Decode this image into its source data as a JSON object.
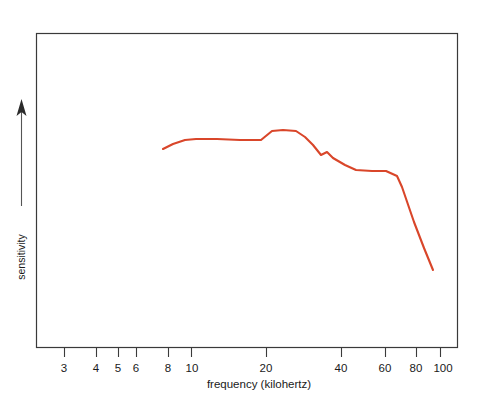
{
  "chart_data": {
    "type": "line",
    "title": "",
    "xlabel": "frequency (kilohertz)",
    "ylabel": "sensitivity",
    "x_scale": "log",
    "xlim": [
      2.4,
      115
    ],
    "ylim": [
      0,
      1
    ],
    "y_axis_ticks": false,
    "y_axis_numeric": false,
    "grid": false,
    "legend": null,
    "frame": "box",
    "xticks": [
      {
        "value": 3,
        "label": "3",
        "px": 64
      },
      {
        "value": 4,
        "label": "4",
        "px": 96
      },
      {
        "value": 5,
        "label": "5",
        "px": 118
      },
      {
        "value": 6,
        "label": "6",
        "px": 136
      },
      {
        "value": 8,
        "label": "8",
        "px": 168
      },
      {
        "value": 10,
        "label": "10",
        "px": 191
      },
      {
        "value": 20,
        "label": "20",
        "px": 266
      },
      {
        "value": 40,
        "label": "40",
        "px": 341
      },
      {
        "value": 60,
        "label": "60",
        "px": 385
      },
      {
        "value": 80,
        "label": "80",
        "px": 416
      },
      {
        "value": 100,
        "label": "100",
        "px": 440
      }
    ],
    "series": [
      {
        "name": "sensitivity curve",
        "color": "#D9462A",
        "points_px": [
          [
            163,
            149
          ],
          [
            173,
            144
          ],
          [
            185,
            140
          ],
          [
            196,
            139
          ],
          [
            217,
            139
          ],
          [
            240,
            140
          ],
          [
            261,
            140
          ],
          [
            272,
            131
          ],
          [
            283,
            130
          ],
          [
            296,
            131
          ],
          [
            305,
            137
          ],
          [
            313,
            145
          ],
          [
            321,
            155
          ],
          [
            327,
            152
          ],
          [
            333,
            158
          ],
          [
            345,
            165
          ],
          [
            356,
            170
          ],
          [
            372,
            171
          ],
          [
            386,
            171
          ],
          [
            397,
            176
          ],
          [
            402,
            187
          ],
          [
            414,
            222
          ],
          [
            424,
            248
          ],
          [
            433,
            270
          ]
        ],
        "points_data": [
          {
            "frequency": 7.6,
            "sensitivity": 0.63
          },
          {
            "frequency": 8.6,
            "sensitivity": 0.65
          },
          {
            "frequency": 9.8,
            "sensitivity": 0.67
          },
          {
            "frequency": 11.0,
            "sensitivity": 0.68
          },
          {
            "frequency": 13.7,
            "sensitivity": 0.68
          },
          {
            "frequency": 17.4,
            "sensitivity": 0.67
          },
          {
            "frequency": 21.5,
            "sensitivity": 0.67
          },
          {
            "frequency": 24.0,
            "sensitivity": 0.7
          },
          {
            "frequency": 26.5,
            "sensitivity": 0.7
          },
          {
            "frequency": 30.0,
            "sensitivity": 0.7
          },
          {
            "frequency": 32.7,
            "sensitivity": 0.68
          },
          {
            "frequency": 35.3,
            "sensitivity": 0.65
          },
          {
            "frequency": 38.0,
            "sensitivity": 0.61
          },
          {
            "frequency": 40.1,
            "sensitivity": 0.62
          },
          {
            "frequency": 42.3,
            "sensitivity": 0.6
          },
          {
            "frequency": 47.0,
            "sensitivity": 0.58
          },
          {
            "frequency": 51.5,
            "sensitivity": 0.56
          },
          {
            "frequency": 58.5,
            "sensitivity": 0.56
          },
          {
            "frequency": 65.5,
            "sensitivity": 0.56
          },
          {
            "frequency": 71.5,
            "sensitivity": 0.54
          },
          {
            "frequency": 74.5,
            "sensitivity": 0.5
          },
          {
            "frequency": 82.0,
            "sensitivity": 0.39
          },
          {
            "frequency": 88.5,
            "sensitivity": 0.3
          },
          {
            "frequency": 94.5,
            "sensitivity": 0.23
          }
        ]
      }
    ],
    "annotations": [
      {
        "name": "y-axis-arrow",
        "direction": "up",
        "meaning": "increasing sensitivity"
      }
    ],
    "colors": {
      "curve": "#D9462A",
      "frame": "#3a3a3a",
      "arrow": "#2b2b2b",
      "text": "#1a1a1a",
      "background": "#ffffff"
    }
  }
}
